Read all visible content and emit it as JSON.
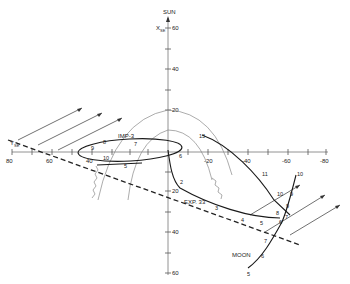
{
  "axes": {
    "vertical": {
      "label": "SUN",
      "sublabel": "X",
      "sublabel_sub": "SE",
      "ticks": [
        "60",
        "40",
        "20",
        "20",
        "40",
        "60"
      ]
    },
    "horizontal": {
      "label": "Y",
      "label_sub": "SE",
      "ticks": [
        "80",
        "60",
        "40",
        "20",
        "-20",
        "-40",
        "-60",
        "-80"
      ]
    }
  },
  "labels": {
    "imp3": "IMP-3",
    "exp33": "EXP. 33",
    "moon": "MOON"
  },
  "markers": {
    "imp3": [
      "8",
      "9",
      "10",
      "5",
      "6",
      "7"
    ],
    "exp33": [
      "2",
      "3",
      "4",
      "5",
      "6",
      "7",
      "8",
      "9",
      "10",
      "11",
      "13"
    ],
    "moon": [
      "5",
      "6",
      "7",
      "8",
      "9",
      "10"
    ]
  },
  "colors": {
    "line": "#1a1a1a",
    "axis": "#777777",
    "background": "#ffffff"
  }
}
